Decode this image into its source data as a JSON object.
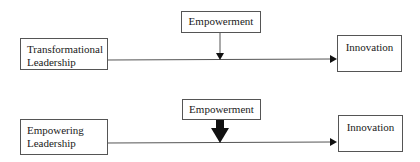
{
  "diagrams": [
    {
      "name": "transformational-model",
      "predictor": {
        "label": "Transformational\nLeadership"
      },
      "moderator": {
        "label": "Empowerment",
        "arrow_weight": "thin"
      },
      "outcome": {
        "label": "Innovation"
      }
    },
    {
      "name": "empowering-model",
      "predictor": {
        "label": "Empowering\nLeadership"
      },
      "moderator": {
        "label": "Empowerment",
        "arrow_weight": "thick"
      },
      "outcome": {
        "label": "Innovation"
      }
    }
  ],
  "colors": {
    "line": "#555555",
    "arrow_fill": "#111111",
    "box_border": "#555555",
    "text": "#1a1a1a",
    "background": "#ffffff"
  }
}
